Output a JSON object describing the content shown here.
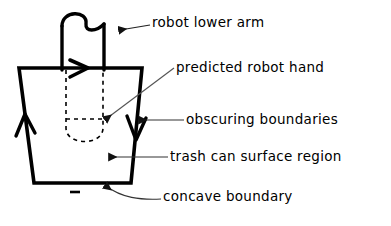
{
  "figure": {
    "background_color": "#ffffff",
    "stroke_color": "#000000",
    "leader_color": "#555555"
  },
  "labels": {
    "robot_lower_arm": "robot lower arm",
    "predicted_robot_hand": "predicted robot hand",
    "obscuring_boundaries": "obscuring boundaries",
    "trash_can_surface_region": "trash can surface region",
    "concave_boundary": "concave boundary"
  },
  "shapes": {
    "robot_arm": {
      "name": "robot-lower-arm-shape",
      "description": "vertical bar with rounded twin-hump top",
      "left_x": 62,
      "right_x": 104,
      "top_y": 10,
      "bottom_y": 70
    },
    "trash_can": {
      "name": "trash-can-trapezoid",
      "top_left": [
        19,
        68
      ],
      "top_right": [
        142,
        68
      ],
      "bottom_right": [
        131,
        183
      ],
      "bottom_left": [
        34,
        183
      ]
    },
    "predicted_hand": {
      "name": "predicted-hand-dashed-region",
      "dash_pattern": "4 4",
      "left_x": 66,
      "right_x": 103,
      "top_y": 70,
      "bottom_y": 142,
      "cross_line_y": 119
    },
    "bottom_tick": {
      "name": "concave-boundary-tick",
      "x1": 70,
      "x2": 80,
      "y": 192
    }
  },
  "arrow_markers": [
    {
      "name": "top-edge-arrow",
      "direction": "right",
      "x": 83,
      "y": 68
    },
    {
      "name": "left-edge-arrow",
      "direction": "up",
      "x": 25,
      "y": 123
    },
    {
      "name": "right-edge-arrow",
      "direction": "down",
      "x": 136,
      "y": 126
    }
  ],
  "leaders": [
    {
      "name": "leader-robot-lower-arm",
      "points": "150,25 118,30",
      "arrow": "left"
    },
    {
      "name": "leader-predicted-robot-hand",
      "points": "174,68 104,120",
      "arrow": "down-left"
    },
    {
      "name": "leader-obscuring-boundaries",
      "points": "184,120 138,120",
      "arrow": "left"
    },
    {
      "name": "leader-trash-can-surface-region",
      "points": "168,157 108,157",
      "arrow": "left"
    },
    {
      "name": "leader-concave-boundary",
      "points": "161,199 120,196 104,185",
      "arrow": "up-left"
    }
  ]
}
